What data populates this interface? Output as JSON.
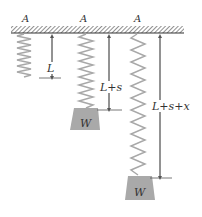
{
  "diagram": {
    "ceiling_labels": [
      "A",
      "A",
      "A"
    ],
    "springs": [
      {
        "id": "unloaded",
        "dimension_label": "L",
        "weight_label": null
      },
      {
        "id": "equilibrium",
        "dimension_label": "L+s",
        "weight_label": "W"
      },
      {
        "id": "stretched",
        "dimension_label": "L+s+x",
        "weight_label": "W"
      }
    ],
    "colors": {
      "spring": "#a8a8a8",
      "weight": "#a9a9a9",
      "ceiling": "#555555",
      "arrow": "#555555",
      "text": "#333333"
    }
  }
}
